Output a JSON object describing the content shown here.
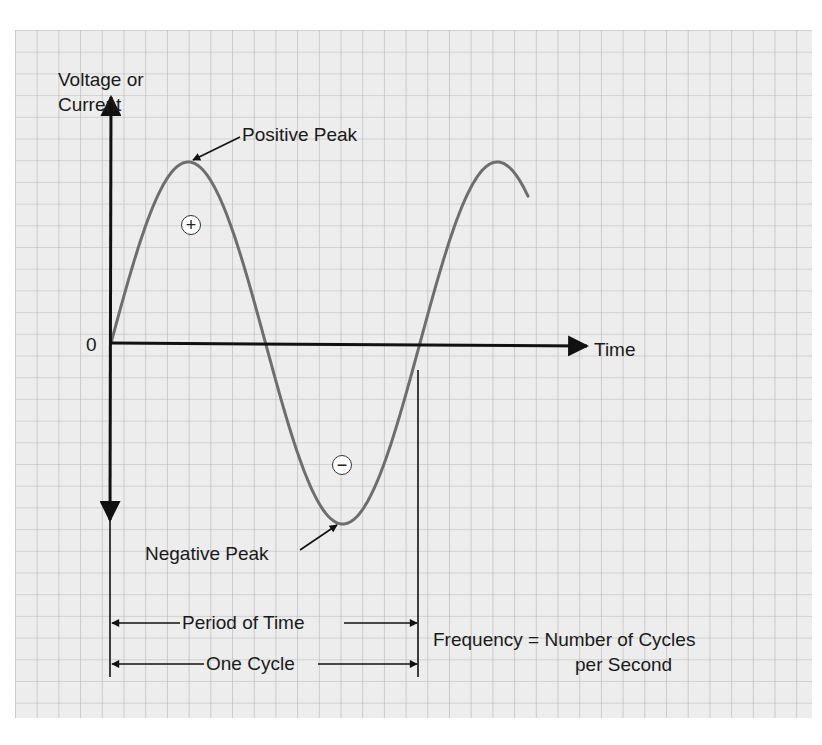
{
  "diagram": {
    "type": "sine-wave",
    "y_axis_label_line1": "Voltage or",
    "y_axis_label_line2": "Current",
    "x_axis_label": "Time",
    "origin_label": "0",
    "positive_peak_label": "Positive Peak",
    "negative_peak_label": "Negative Peak",
    "positive_half_symbol": "+",
    "negative_half_symbol": "−",
    "period_label": "Period of Time",
    "cycle_label": "One Cycle",
    "frequency_line1": "Frequency = Number of Cycles",
    "frequency_line2": "per Second"
  },
  "colors": {
    "background": "#ffffff",
    "grid_fill": "#ededed",
    "grid_line": "#b5b5b5",
    "curve": "#6e6e6e",
    "axis": "#111111",
    "text": "#1a1a1a"
  },
  "geometry": {
    "grid": {
      "x": 15,
      "y": 30,
      "width": 797,
      "height": 688,
      "cell": 21.7
    },
    "origin": {
      "x": 111,
      "y": 343
    },
    "x_axis_end": 587,
    "y_axis_top": 97,
    "y_axis_bottom": 520,
    "wave": {
      "start_x": 111,
      "period_px": 309,
      "amplitude_px": 181,
      "end_x": 528,
      "positive_peak": {
        "x": 188,
        "y": 161
      },
      "negative_peak": {
        "x": 341,
        "y": 523
      }
    },
    "period_line": {
      "y": 623,
      "x1": 111,
      "x2": 418
    },
    "cycle_line": {
      "y": 664,
      "x1": 111,
      "x2": 418
    },
    "right_marker": {
      "x": 418,
      "y1": 370,
      "y2": 677
    },
    "left_marker_bottom": 677
  }
}
